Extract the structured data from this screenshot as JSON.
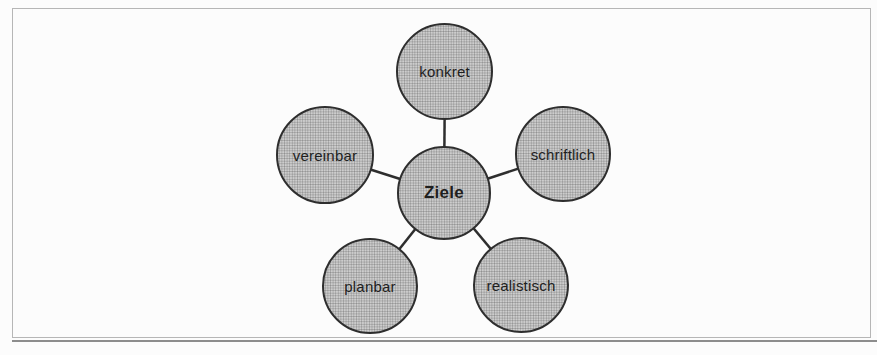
{
  "diagram": {
    "center": {
      "label": "Ziele"
    },
    "satellites": [
      {
        "label": "konkret",
        "position": "top"
      },
      {
        "label": "schriftlich",
        "position": "right"
      },
      {
        "label": "vereinbar",
        "position": "left"
      },
      {
        "label": "planbar",
        "position": "bottom-left"
      },
      {
        "label": "realistisch",
        "position": "bottom-right"
      }
    ],
    "colors": {
      "circle_fill": "#cdcdcd",
      "circle_halftone_dot": "#8e8e8e",
      "circle_border": "#2e2e2e",
      "connector": "#2e2e2e",
      "frame_border": "#b6b6b6",
      "bottom_rule": "#8d8d8d",
      "text": "#1f1f1f",
      "background": "#fcfcfc"
    }
  }
}
